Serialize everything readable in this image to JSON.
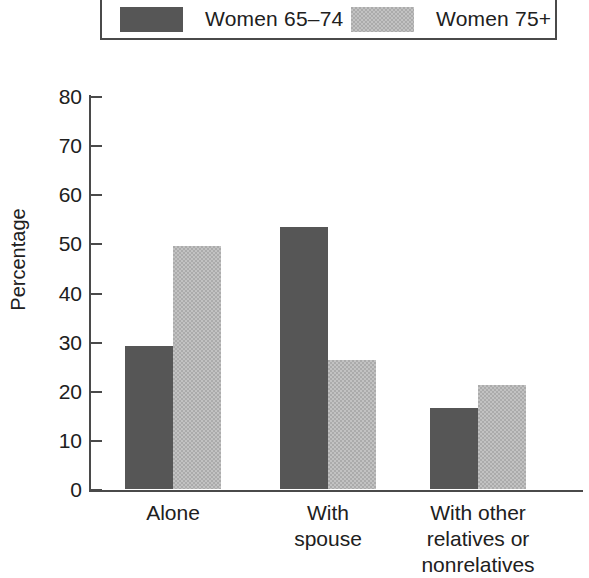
{
  "chart_data": {
    "type": "bar",
    "title": "",
    "subtitle": "",
    "xlabel": "",
    "ylabel": "Percentage",
    "ylim": [
      0,
      80
    ],
    "ytick_labels": [
      "80",
      "70",
      "60",
      "50",
      "40",
      "30",
      "20",
      "10",
      "0"
    ],
    "ytick_values": [
      80,
      70,
      60,
      50,
      40,
      30,
      20,
      10,
      0
    ],
    "grid": false,
    "legend_position": "top",
    "categories": [
      "Alone",
      "With spouse",
      "With other relatives or nonrelatives"
    ],
    "category_lines": [
      [
        "Alone"
      ],
      [
        "With",
        "spouse"
      ],
      [
        "With other",
        "relatives or",
        "nonrelatives"
      ]
    ],
    "series": [
      {
        "name": "Women 65–74",
        "color": "#565656",
        "pattern": "solid",
        "values": [
          29.2,
          53.4,
          16.4
        ]
      },
      {
        "name": "Women 75+",
        "color": "#ababab",
        "pattern": "dither",
        "values": [
          49.4,
          26.2,
          21.2
        ]
      }
    ]
  },
  "legend": {
    "entries": [
      {
        "label": "Women 65–74",
        "swatch": "legend-swatch-dark"
      },
      {
        "label": "Women 75+",
        "swatch": "legend-swatch-light"
      }
    ]
  },
  "axes": {
    "y_title": "Percentage"
  }
}
